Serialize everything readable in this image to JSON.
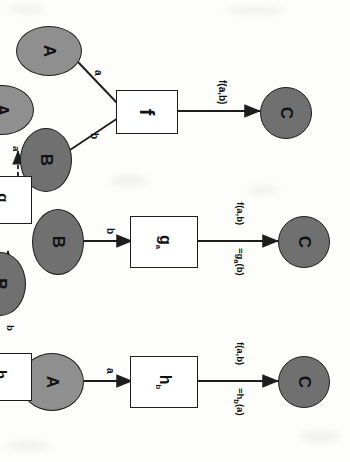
{
  "diagram": {
    "type": "function-currying-diagram",
    "background_color": "#fdfdfc",
    "node_fill": "#8f8f8f",
    "node_fill_dark": "#707070",
    "box_fill": "#ffffff",
    "stroke_color": "#1d1d1d",
    "rotation_degrees": 90,
    "panels": [
      {
        "id": "panel-f",
        "name": "binary-function-f",
        "nodes": [
          {
            "id": "A",
            "label": "A",
            "shape": "ellipse",
            "fill": "#8f8f8f"
          },
          {
            "id": "B",
            "label": "B",
            "shape": "ellipse",
            "fill": "#707070"
          },
          {
            "id": "f",
            "label": "f",
            "shape": "box",
            "fill": "#ffffff"
          },
          {
            "id": "C",
            "label": "C",
            "shape": "circle",
            "fill": "#707070"
          }
        ],
        "edges": [
          {
            "from": "A",
            "to": "f",
            "label": "a",
            "style": "solid"
          },
          {
            "from": "B",
            "to": "f",
            "label": "b",
            "style": "solid"
          },
          {
            "from": "f",
            "to": "C",
            "label": "f(a,b)",
            "style": "solid",
            "arrow": true
          }
        ]
      },
      {
        "id": "panel-g",
        "name": "partial-application-g",
        "nodes": [
          {
            "id": "B",
            "label": "B",
            "shape": "ellipse",
            "fill": "#707070"
          },
          {
            "id": "ga",
            "label": "g",
            "sublabel": "a",
            "shape": "box",
            "fill": "#ffffff"
          },
          {
            "id": "C",
            "label": "C",
            "shape": "circle",
            "fill": "#707070"
          }
        ],
        "edges": [
          {
            "from": "B",
            "to": "ga",
            "label": "b",
            "style": "solid",
            "arrow": true
          },
          {
            "from": "ga",
            "to": "C",
            "label": "f(a,b)",
            "label2": "=g",
            "label2_sub": "a",
            "label2_tail": "(b)",
            "style": "solid",
            "arrow": true
          }
        ]
      },
      {
        "id": "panel-h",
        "name": "partial-application-h",
        "nodes": [
          {
            "id": "A",
            "label": "A",
            "shape": "ellipse",
            "fill": "#8f8f8f"
          },
          {
            "id": "hb",
            "label": "h",
            "sublabel": "b",
            "shape": "box",
            "fill": "#ffffff"
          },
          {
            "id": "C",
            "label": "C",
            "shape": "circle",
            "fill": "#707070"
          }
        ],
        "edges": [
          {
            "from": "A",
            "to": "hb",
            "label": "a",
            "style": "solid",
            "arrow": true
          },
          {
            "from": "hb",
            "to": "C",
            "label": "f(a,b)",
            "label2": "=h",
            "label2_sub": "b",
            "label2_tail": "(a)",
            "style": "solid",
            "arrow": true
          }
        ]
      },
      {
        "id": "panel-curry-g",
        "name": "currying-A-to-ga",
        "nodes": [
          {
            "id": "A",
            "label": "A",
            "shape": "ellipse",
            "fill": "#8f8f8f"
          },
          {
            "id": "ga",
            "label": "g",
            "sublabel": "a",
            "shape": "box",
            "fill": "#ffffff"
          }
        ],
        "edges": [
          {
            "from": "A",
            "to": "ga",
            "label": "a",
            "style": "dashed",
            "arrow": true
          }
        ]
      },
      {
        "id": "panel-curry-h",
        "name": "currying-B-to-hb",
        "nodes": [
          {
            "id": "B",
            "label": "B",
            "shape": "ellipse",
            "fill": "#707070"
          },
          {
            "id": "hb",
            "label": "h",
            "sublabel": "b",
            "shape": "box",
            "fill": "#ffffff"
          }
        ],
        "edges": [
          {
            "from": "B",
            "to": "hb",
            "label": "b",
            "style": "dashed",
            "arrow": true
          }
        ]
      }
    ],
    "labels": {
      "A": "A",
      "B": "B",
      "C": "C",
      "f": "f",
      "g": "g",
      "h": "h",
      "sub_a": "a",
      "sub_b": "b",
      "edge_a": "a",
      "edge_b": "b",
      "f_of_ab": "f(a,b)",
      "eq_g": "=g",
      "eq_g_tail": "(b)",
      "eq_h": "=h",
      "eq_h_tail": "(a)"
    }
  }
}
